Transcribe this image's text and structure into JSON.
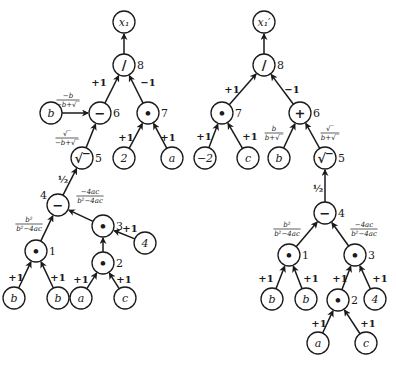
{
  "diagrams": [
    {
      "name": "left-graph",
      "nodes": [
        {
          "id": "x1",
          "label": "x₁",
          "x": 124,
          "y": 22,
          "r": 11,
          "op": false
        },
        {
          "id": "n8",
          "label": "/",
          "x": 124,
          "y": 65,
          "r": 11,
          "op": true,
          "index": "8"
        },
        {
          "id": "n6",
          "label": "−",
          "x": 100,
          "y": 113,
          "r": 11,
          "op": true,
          "index": "6"
        },
        {
          "id": "n7",
          "label": "•",
          "x": 148,
          "y": 113,
          "r": 11,
          "op": true,
          "index": "7"
        },
        {
          "id": "b6",
          "label": "b",
          "x": 51,
          "y": 113,
          "r": 11,
          "op": false
        },
        {
          "id": "n5",
          "label": "√‾",
          "x": 82,
          "y": 158,
          "r": 11,
          "op": true,
          "index": "5"
        },
        {
          "id": "two",
          "label": "2",
          "x": 124,
          "y": 158,
          "r": 11,
          "op": false
        },
        {
          "id": "a7",
          "label": "a",
          "x": 172,
          "y": 158,
          "r": 11,
          "op": false
        },
        {
          "id": "n4",
          "label": "−",
          "x": 58,
          "y": 205,
          "r": 11,
          "op": true,
          "index": "4"
        },
        {
          "id": "n1",
          "label": "•",
          "x": 36,
          "y": 251,
          "r": 11,
          "op": true,
          "index": "1"
        },
        {
          "id": "n3",
          "label": "•",
          "x": 103,
          "y": 226,
          "r": 11,
          "op": true,
          "index": "3"
        },
        {
          "id": "four",
          "label": "4",
          "x": 145,
          "y": 243,
          "r": 11,
          "op": false
        },
        {
          "id": "n2",
          "label": "•",
          "x": 103,
          "y": 263,
          "r": 11,
          "op": true,
          "index": "2"
        },
        {
          "id": "b1",
          "label": "b",
          "x": 14,
          "y": 298,
          "r": 11,
          "op": false
        },
        {
          "id": "b2",
          "label": "b",
          "x": 58,
          "y": 298,
          "r": 11,
          "op": false
        },
        {
          "id": "a2",
          "label": "a",
          "x": 81,
          "y": 298,
          "r": 11,
          "op": false
        },
        {
          "id": "c2",
          "label": "c",
          "x": 125,
          "y": 298,
          "r": 11,
          "op": false
        }
      ],
      "edges": [
        {
          "from": "n8",
          "to": "x1"
        },
        {
          "from": "n6",
          "to": "n8",
          "label": "+1",
          "lx": 99,
          "ly": 82
        },
        {
          "from": "n7",
          "to": "n8",
          "label": "−1",
          "lx": 148,
          "ly": 82
        },
        {
          "from": "b6",
          "to": "n6",
          "num": "−b",
          "den": "−b+√‾",
          "lx": 68,
          "ly": 100
        },
        {
          "from": "n5",
          "to": "n6",
          "num": "√‾",
          "den": "−b+√‾",
          "lx": 67,
          "ly": 138
        },
        {
          "from": "two",
          "to": "n7",
          "label": "+1",
          "lx": 126,
          "ly": 137
        },
        {
          "from": "a7",
          "to": "n7",
          "label": "+1",
          "lx": 168,
          "ly": 137
        },
        {
          "from": "n4",
          "to": "n5",
          "label": "½",
          "lx": 63,
          "ly": 179
        },
        {
          "from": "n1",
          "to": "n4",
          "num": "b²",
          "den": "b²−4ac",
          "lx": 29,
          "ly": 224
        },
        {
          "from": "n3",
          "to": "n4",
          "num": "−4ac",
          "den": "b²−4ac",
          "lx": 90,
          "ly": 196
        },
        {
          "from": "four",
          "to": "n3",
          "label": "+1",
          "lx": 130,
          "ly": 228
        },
        {
          "from": "n2",
          "to": "n3"
        },
        {
          "from": "b1",
          "to": "n1",
          "label": "+1",
          "lx": 16,
          "ly": 277
        },
        {
          "from": "b2",
          "to": "n1",
          "label": "+1",
          "lx": 58,
          "ly": 277
        },
        {
          "from": "a2",
          "to": "n2",
          "label": "+1",
          "lx": 81,
          "ly": 279
        },
        {
          "from": "c2",
          "to": "n2",
          "label": "+1",
          "lx": 124,
          "ly": 279
        }
      ]
    },
    {
      "name": "right-graph",
      "nodes": [
        {
          "id": "x1p",
          "label": "x₁′",
          "x": 264,
          "y": 22,
          "r": 11,
          "op": false
        },
        {
          "id": "m8",
          "label": "/",
          "x": 264,
          "y": 65,
          "r": 11,
          "op": true,
          "index": "8"
        },
        {
          "id": "m7",
          "label": "•",
          "x": 222,
          "y": 113,
          "r": 11,
          "op": true,
          "index": "7"
        },
        {
          "id": "m6",
          "label": "+",
          "x": 300,
          "y": 113,
          "r": 11,
          "op": true,
          "index": "6"
        },
        {
          "id": "neg2",
          "label": "−2",
          "x": 205,
          "y": 158,
          "r": 11,
          "op": false
        },
        {
          "id": "cm7",
          "label": "c",
          "x": 248,
          "y": 158,
          "r": 11,
          "op": false
        },
        {
          "id": "bm6",
          "label": "b",
          "x": 279,
          "y": 158,
          "r": 11,
          "op": false
        },
        {
          "id": "m5",
          "label": "√‾",
          "x": 325,
          "y": 158,
          "r": 11,
          "op": true,
          "index": "5"
        },
        {
          "id": "m4",
          "label": "−",
          "x": 325,
          "y": 213,
          "r": 11,
          "op": true,
          "index": "4"
        },
        {
          "id": "m1",
          "label": "•",
          "x": 289,
          "y": 255,
          "r": 11,
          "op": true,
          "index": "1"
        },
        {
          "id": "m3",
          "label": "•",
          "x": 355,
          "y": 255,
          "r": 11,
          "op": true,
          "index": "3"
        },
        {
          "id": "bm1",
          "label": "b",
          "x": 272,
          "y": 299,
          "r": 11,
          "op": false
        },
        {
          "id": "bm2",
          "label": "b",
          "x": 306,
          "y": 299,
          "r": 11,
          "op": false
        },
        {
          "id": "m2",
          "label": "•",
          "x": 338,
          "y": 300,
          "r": 11,
          "op": true,
          "index": "2"
        },
        {
          "id": "fourm",
          "label": "4",
          "x": 375,
          "y": 299,
          "r": 11,
          "op": false
        },
        {
          "id": "am",
          "label": "a",
          "x": 318,
          "y": 343,
          "r": 11,
          "op": false
        },
        {
          "id": "cm",
          "label": "c",
          "x": 366,
          "y": 343,
          "r": 11,
          "op": false
        }
      ],
      "edges": [
        {
          "from": "m8",
          "to": "x1p"
        },
        {
          "from": "m7",
          "to": "m8",
          "label": "+1",
          "lx": 232,
          "ly": 89
        },
        {
          "from": "m6",
          "to": "m8",
          "label": "−1",
          "lx": 292,
          "ly": 89
        },
        {
          "from": "neg2",
          "to": "m7",
          "label": "+1",
          "lx": 204,
          "ly": 136
        },
        {
          "from": "cm7",
          "to": "m7",
          "label": "+1",
          "lx": 250,
          "ly": 136
        },
        {
          "from": "bm6",
          "to": "m6",
          "num": "b",
          "den": "b+√‾",
          "lx": 274,
          "ly": 133
        },
        {
          "from": "m5",
          "to": "m6",
          "num": "√‾",
          "den": "b+√‾",
          "lx": 330,
          "ly": 133
        },
        {
          "from": "m4",
          "to": "m5",
          "label": "½",
          "lx": 318,
          "ly": 188
        },
        {
          "from": "m1",
          "to": "m4",
          "num": "b²",
          "den": "b²−4ac",
          "lx": 287,
          "ly": 229
        },
        {
          "from": "m3",
          "to": "m4",
          "num": "−4ac",
          "den": "b²−4ac",
          "lx": 364,
          "ly": 229
        },
        {
          "from": "bm1",
          "to": "m1",
          "label": "+1",
          "lx": 266,
          "ly": 278
        },
        {
          "from": "bm2",
          "to": "m1",
          "label": "+1",
          "lx": 311,
          "ly": 278
        },
        {
          "from": "m2",
          "to": "m3",
          "label": "+1",
          "lx": 340,
          "ly": 278
        },
        {
          "from": "fourm",
          "to": "m3",
          "label": "+1",
          "lx": 380,
          "ly": 278
        },
        {
          "from": "am",
          "to": "m2",
          "label": "+1",
          "lx": 319,
          "ly": 323
        },
        {
          "from": "cm",
          "to": "m2",
          "label": "+1",
          "lx": 368,
          "ly": 323
        }
      ]
    }
  ]
}
